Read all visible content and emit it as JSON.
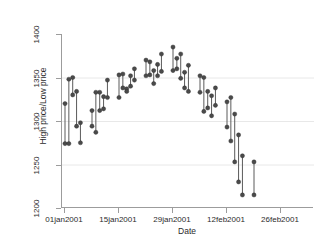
{
  "chart_data": {
    "type": "line",
    "subtype": "high-low range plot",
    "title": "",
    "xlabel": "Date",
    "ylabel": "High price/Low price",
    "ylim": [
      1200,
      1400
    ],
    "yticks": [
      1200,
      1250,
      1300,
      1350,
      1400
    ],
    "ytick_labels": [
      "1200",
      "1250",
      "1300",
      "1350",
      "1400"
    ],
    "xlim": [
      "01jan2001",
      "28feb2001"
    ],
    "xticks": [
      "01jan2001",
      "15jan2001",
      "29jan2001",
      "12feb2001",
      "26feb2001"
    ],
    "xtick_labels": [
      "01jan2001",
      "15jan2001",
      "29jan2001",
      "12feb2001",
      "26feb2001"
    ],
    "grid": "horizontal",
    "legend": "none",
    "marker": "filled circle",
    "series": [
      {
        "name": "High price",
        "values": [
          1320,
          1348,
          1350,
          1334,
          1298,
          1312,
          1333,
          1333,
          1328,
          1347,
          1353,
          1354,
          1337,
          1352,
          1360,
          1370,
          1368,
          1358,
          1365,
          1377,
          1385,
          1372,
          1377,
          1356,
          1364,
          1352,
          1350,
          1334,
          1329,
          1338,
          1322,
          1327,
          1308,
          1284,
          1260,
          1253
        ]
      },
      {
        "name": "Low price",
        "values": [
          1274,
          1274,
          1330,
          1294,
          1275,
          1294,
          1287,
          1312,
          1314,
          1327,
          1327,
          1338,
          1334,
          1340,
          1347,
          1352,
          1353,
          1343,
          1352,
          1357,
          1358,
          1360,
          1349,
          1338,
          1334,
          1333,
          1311,
          1315,
          1306,
          1318,
          1293,
          1277,
          1253,
          1230,
          1215,
          1215
        ]
      }
    ],
    "x": [
      "01jan2001",
      "02jan2001",
      "03jan2001",
      "04jan2001",
      "05jan2001",
      "08jan2001",
      "09jan2001",
      "10jan2001",
      "11jan2001",
      "12jan2001",
      "15jan2001",
      "16jan2001",
      "17jan2001",
      "18jan2001",
      "19jan2001",
      "22jan2001",
      "23jan2001",
      "24jan2001",
      "25jan2001",
      "26jan2001",
      "29jan2001",
      "30jan2001",
      "31jan2001",
      "01feb2001",
      "02feb2001",
      "05feb2001",
      "06feb2001",
      "07feb2001",
      "08feb2001",
      "09feb2001",
      "12feb2001",
      "13feb2001",
      "14feb2001",
      "15feb2001",
      "16feb2001",
      "19feb2001"
    ],
    "n_observations": 36,
    "colors": {
      "marker": "#4a4a4a",
      "line": "#5a5a5a",
      "grid": "#e8e8e8",
      "axis": "#9c9c9c",
      "background": "#ffffff",
      "text": "#2b2b2b"
    }
  }
}
